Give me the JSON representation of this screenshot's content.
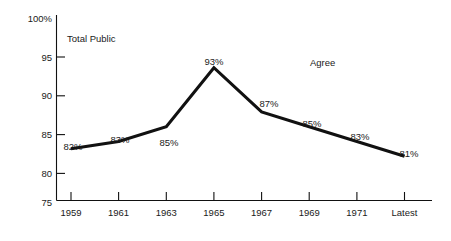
{
  "chart_data": {
    "type": "line",
    "title": "",
    "subtitle": "",
    "xlabel": "",
    "ylabel": "",
    "grid": false,
    "legend_position": "none",
    "ylim": [
      75,
      100
    ],
    "y_ticks": [
      "75",
      "80",
      "85",
      "90",
      "95",
      "100%"
    ],
    "y_tick_values": [
      75,
      80,
      85,
      90,
      95,
      100
    ],
    "categories": [
      "1959",
      "1961",
      "1963",
      "1965",
      "1967",
      "1969",
      "1971",
      "Latest"
    ],
    "values": [
      82,
      83,
      85,
      93,
      87,
      85,
      83,
      81
    ],
    "point_labels": [
      "82%",
      "83%",
      "85%",
      "93%",
      "87%",
      "85%",
      "83%",
      "81%"
    ],
    "annotations": [
      {
        "name": "total-public",
        "text": "Total Public"
      },
      {
        "name": "agree",
        "text": "Agree"
      }
    ]
  },
  "colors": {
    "line": "#111111",
    "axis": "#111111",
    "text": "#1a1a1a",
    "background": "#ffffff"
  }
}
